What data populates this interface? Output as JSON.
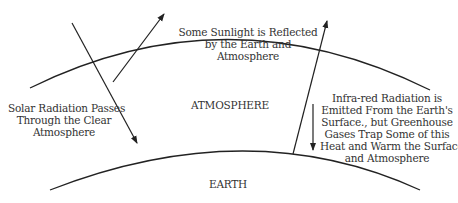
{
  "labels": {
    "reflected": [
      "Some Sunlight is Reflected",
      "by the Earth and",
      "Atmosphere"
    ],
    "solar": [
      "Solar Radiation Passes",
      "Through the Clear",
      "Atmosphere"
    ],
    "atmosphere": "ATMOSPHERE",
    "infrared": [
      "Infra-red Radiation is",
      "Emitted From the Earth's",
      "Surface., but Greenhouse",
      "Gases Trap Some of this",
      "Heat and Warm the Surface",
      "and Atmosphere"
    ],
    "earth": "EARTH"
  },
  "colors": {
    "stroke": "#222222",
    "text": "#333333"
  }
}
